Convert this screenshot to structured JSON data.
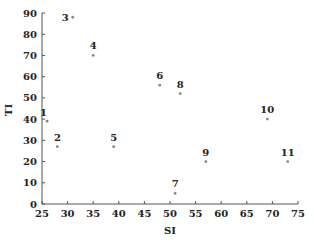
{
  "chart_data": {
    "type": "scatter",
    "title": "",
    "xlabel": "SI",
    "ylabel": "TI",
    "xlim": [
      25,
      75
    ],
    "ylim": [
      0,
      90
    ],
    "xticks": [
      25,
      30,
      35,
      40,
      45,
      50,
      55,
      60,
      65,
      70,
      75
    ],
    "yticks": [
      0,
      10,
      20,
      30,
      40,
      50,
      60,
      70,
      80,
      90
    ],
    "grid": false,
    "legend": null,
    "points": [
      {
        "label": "1",
        "x": 26,
        "y": 39
      },
      {
        "label": "2",
        "x": 28,
        "y": 27
      },
      {
        "label": "3",
        "x": 31,
        "y": 88
      },
      {
        "label": "4",
        "x": 35,
        "y": 70
      },
      {
        "label": "5",
        "x": 39,
        "y": 27
      },
      {
        "label": "6",
        "x": 48,
        "y": 56
      },
      {
        "label": "7",
        "x": 51,
        "y": 5
      },
      {
        "label": "8",
        "x": 52,
        "y": 52
      },
      {
        "label": "9",
        "x": 57,
        "y": 20
      },
      {
        "label": "10",
        "x": 69,
        "y": 40
      },
      {
        "label": "11",
        "x": 73,
        "y": 20
      }
    ],
    "colors": {
      "axis": "#555555",
      "point": "#888888",
      "text": "#222222"
    }
  }
}
